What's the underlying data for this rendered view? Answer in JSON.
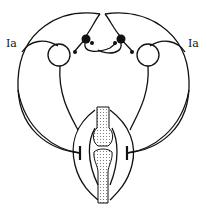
{
  "diagram": {
    "type": "neural-circuit-schematic",
    "labels": {
      "left_afferent": "Ia",
      "right_afferent": "Ia"
    },
    "components": [
      "left-motor-neuron",
      "right-motor-neuron",
      "left-interneuron",
      "right-interneuron",
      "left-muscle",
      "right-muscle",
      "joint-bones"
    ],
    "colors": {
      "stroke": "#111111",
      "background": "#ffffff",
      "bone_dots": "#555555"
    }
  }
}
